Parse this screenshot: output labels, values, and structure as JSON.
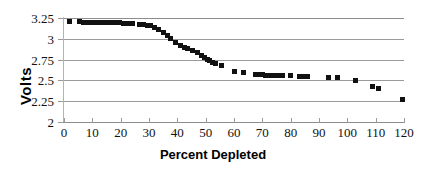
{
  "chart_data": {
    "type": "scatter",
    "title": "",
    "xlabel": "Percent Depleted",
    "ylabel": "Volts",
    "xlim": [
      0,
      120
    ],
    "ylim": [
      2,
      3.25
    ],
    "xticks": [
      0,
      10,
      20,
      30,
      40,
      50,
      60,
      70,
      80,
      90,
      100,
      110,
      120
    ],
    "xtick_labels": [
      "0",
      "10",
      "20",
      "30",
      "40",
      "50",
      "60",
      "70",
      "80",
      "90",
      "100",
      "110",
      "120"
    ],
    "yticks": [
      2,
      2.25,
      2.5,
      2.75,
      3,
      3.25
    ],
    "ytick_labels": [
      "2",
      "2.25",
      "2.5",
      "2.75",
      "3",
      "3.25"
    ],
    "grid": "horizontal",
    "legend": "none",
    "marker": "square",
    "marker_color": "#111111",
    "marker_size_px": 5,
    "series": [
      {
        "name": "Battery discharge",
        "points": [
          [
            2.0,
            3.21
          ],
          [
            5.5,
            3.205
          ],
          [
            7.0,
            3.2
          ],
          [
            8.5,
            3.2
          ],
          [
            10.5,
            3.2
          ],
          [
            12.0,
            3.2
          ],
          [
            13.5,
            3.195
          ],
          [
            15.5,
            3.195
          ],
          [
            17.0,
            3.19
          ],
          [
            18.5,
            3.19
          ],
          [
            19.5,
            3.19
          ],
          [
            21.0,
            3.185
          ],
          [
            22.5,
            3.185
          ],
          [
            24.0,
            3.18
          ],
          [
            26.5,
            3.175
          ],
          [
            28.0,
            3.17
          ],
          [
            29.5,
            3.165
          ],
          [
            30.5,
            3.16
          ],
          [
            32.0,
            3.14
          ],
          [
            33.5,
            3.11
          ],
          [
            35.0,
            3.075
          ],
          [
            36.5,
            3.04
          ],
          [
            37.5,
            3.0
          ],
          [
            39.5,
            2.955
          ],
          [
            41.0,
            2.925
          ],
          [
            42.5,
            2.9
          ],
          [
            43.5,
            2.885
          ],
          [
            45.5,
            2.86
          ],
          [
            47.0,
            2.83
          ],
          [
            48.5,
            2.8
          ],
          [
            49.5,
            2.775
          ],
          [
            50.5,
            2.755
          ],
          [
            51.5,
            2.735
          ],
          [
            52.5,
            2.715
          ],
          [
            53.5,
            2.7
          ],
          [
            55.5,
            2.675
          ],
          [
            60.0,
            2.605
          ],
          [
            63.5,
            2.595
          ],
          [
            67.5,
            2.565
          ],
          [
            68.5,
            2.565
          ],
          [
            70.0,
            2.565
          ],
          [
            71.0,
            2.56
          ],
          [
            72.5,
            2.555
          ],
          [
            73.5,
            2.555
          ],
          [
            74.5,
            2.555
          ],
          [
            76.0,
            2.555
          ],
          [
            77.0,
            2.555
          ],
          [
            80.0,
            2.555
          ],
          [
            83.0,
            2.55
          ],
          [
            84.5,
            2.55
          ],
          [
            86.0,
            2.55
          ],
          [
            93.5,
            2.535
          ],
          [
            96.5,
            2.535
          ],
          [
            103.0,
            2.5
          ],
          [
            109.0,
            2.425
          ],
          [
            111.0,
            2.405
          ],
          [
            119.5,
            2.275
          ]
        ]
      }
    ]
  }
}
